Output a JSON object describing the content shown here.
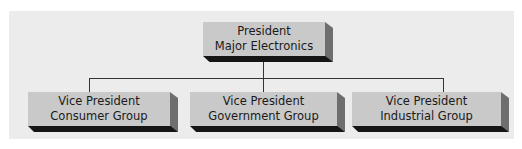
{
  "diagram": {
    "type": "org-chart",
    "root": {
      "line1": "President",
      "line2": "Major Electronics"
    },
    "children": [
      {
        "line1": "Vice President",
        "line2": "Consumer Group"
      },
      {
        "line1": "Vice President",
        "line2": "Government Group"
      },
      {
        "line1": "Vice President",
        "line2": "Industrial Group"
      }
    ],
    "colors": {
      "background": "#ececec",
      "box_face": "#c9c9c9",
      "box_side": "#6e6e6e",
      "box_shadow": "#151515",
      "connector": "#333333"
    }
  }
}
